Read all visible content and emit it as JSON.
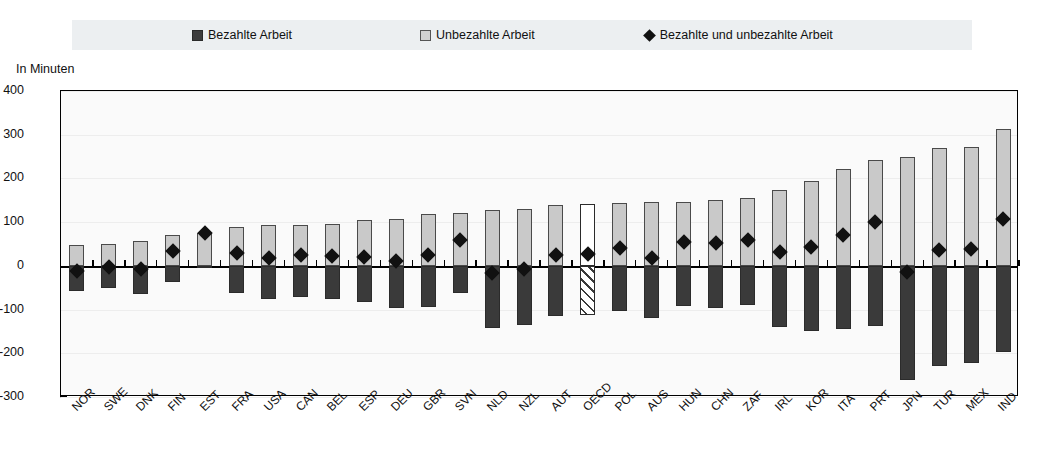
{
  "axis_title": "In Minuten",
  "legend": [
    {
      "label": "Bezahlte Arbeit",
      "marker": "filled-square-dark"
    },
    {
      "label": "Unbezahlte Arbeit",
      "marker": "filled-square-light"
    },
    {
      "label": "Bezahlte und unbezahlte Arbeit",
      "marker": "filled-diamond"
    }
  ],
  "colors": {
    "paid": "#3a3a3a",
    "unpaid": "#c9c9c9",
    "total_marker": "#111111",
    "highlight_fill": "#ffffff",
    "legend_band": "#eceff1",
    "plot_background": "#fafafa"
  },
  "highlight_category": "OECD",
  "chart_data": {
    "type": "bar",
    "title": "",
    "subtitle": "",
    "xlabel": "",
    "ylabel": "In Minuten",
    "ylim": [
      -300,
      400
    ],
    "yticks": [
      400,
      300,
      200,
      100,
      0,
      -100,
      -200,
      -300
    ],
    "ytick_labels": [
      "400",
      "300",
      "200",
      "100",
      "0",
      "-100",
      "-200",
      "-300"
    ],
    "grid": true,
    "legend_position": "top",
    "stacked": "diverging",
    "categories": [
      "NOR",
      "SWE",
      "DNK",
      "FIN",
      "EST",
      "FRA",
      "USA",
      "CAN",
      "BEL",
      "ESP",
      "DEU",
      "GBR",
      "SVN",
      "NLD",
      "NZL",
      "AUT",
      "OECD",
      "POL",
      "AUS",
      "HUN",
      "CHN",
      "ZAF",
      "IRL",
      "KOR",
      "ITA",
      "PRT",
      "JPN",
      "TUR",
      "MEX",
      "IND"
    ],
    "series": [
      {
        "name": "Unbezahlte Arbeit",
        "marker": "filled-square-light",
        "values": [
          47,
          50,
          58,
          70,
          76,
          90,
          93,
          93,
          96,
          104,
          108,
          119,
          122,
          127,
          129,
          140,
          141,
          144,
          146,
          147,
          150,
          156,
          174,
          193,
          222,
          242,
          248,
          270,
          271,
          312
        ]
      },
      {
        "name": "Bezahlte Arbeit",
        "marker": "filled-square-dark",
        "values": [
          -57,
          -50,
          -64,
          -36,
          -3,
          -62,
          -76,
          -71,
          -75,
          -83,
          -96,
          -95,
          -62,
          -143,
          -136,
          -115,
          -112,
          -103,
          -120,
          -93,
          -97,
          -90,
          -141,
          -148,
          -144,
          -138,
          -260,
          -230,
          -222,
          -197
        ]
      },
      {
        "name": "Bezahlte und unbezahlte Arbeit",
        "marker": "filled-diamond",
        "values": [
          -12,
          -2,
          -8,
          35,
          76,
          29,
          18,
          24,
          22,
          21,
          12,
          24,
          60,
          -17,
          -8,
          25,
          28,
          41,
          17,
          54,
          53,
          59,
          31,
          43,
          71,
          101,
          -14,
          37,
          38,
          107
        ]
      }
    ]
  }
}
